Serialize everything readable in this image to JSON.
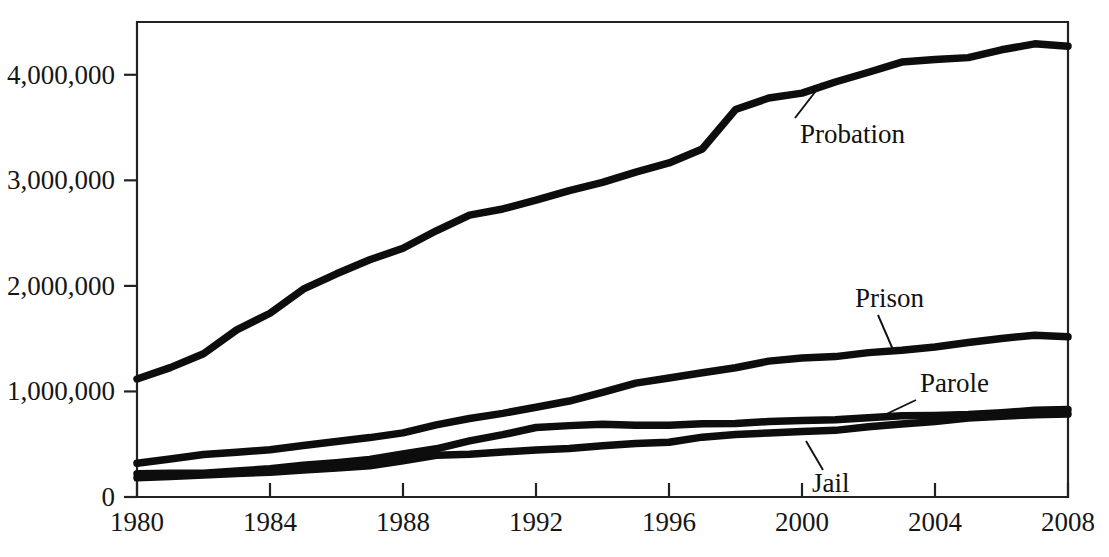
{
  "chart_data": {
    "type": "line",
    "title": "",
    "subtitle": "",
    "xlabel": "",
    "ylabel": "",
    "xlim": [
      1980,
      2008
    ],
    "ylim": [
      0,
      4500000
    ],
    "grid": false,
    "legend_position": "inline-annotations",
    "x_ticks": [
      "1980",
      "1984",
      "1988",
      "1992",
      "1996",
      "2000",
      "2004",
      "2008"
    ],
    "x_tick_values": [
      1980,
      1984,
      1988,
      1992,
      1996,
      2000,
      2004,
      2008
    ],
    "y_ticks": [
      "0",
      "1,000,000",
      "2,000,000",
      "3,000,000",
      "4,000,000"
    ],
    "y_tick_values": [
      0,
      1000000,
      2000000,
      3000000,
      4000000
    ],
    "x": [
      1980,
      1981,
      1982,
      1983,
      1984,
      1985,
      1986,
      1987,
      1988,
      1989,
      1990,
      1991,
      1992,
      1993,
      1994,
      1995,
      1996,
      1997,
      1998,
      1999,
      2000,
      2001,
      2002,
      2003,
      2004,
      2005,
      2006,
      2007,
      2008
    ],
    "series": [
      {
        "name": "Probation",
        "color": "#0d0d0d",
        "values": [
          1118097,
          1225934,
          1357264,
          1582947,
          1740948,
          1968712,
          2114621,
          2247158,
          2356483,
          2522125,
          2670234,
          2728472,
          2811611,
          2903061,
          2981022,
          3077861,
          3164996,
          3296513,
          3670441,
          3779922,
          3826209,
          3931731,
          4024067,
          4120012,
          4143792,
          4162536,
          4236800,
          4293163,
          4270917
        ]
      },
      {
        "name": "Prison",
        "color": "#0d0d0d",
        "values": [
          319598,
          360029,
          402914,
          423898,
          448264,
          487593,
          526436,
          562814,
          607766,
          683367,
          743382,
          792535,
          850566,
          909381,
          990147,
          1078542,
          1127528,
          1176564,
          1224469,
          1287172,
          1316333,
          1330007,
          1367856,
          1390279,
          1421345,
          1462866,
          1502179,
          1532817,
          1518559
        ]
      },
      {
        "name": "Parole",
        "color": "#0d0d0d",
        "values": [
          220438,
          225539,
          224604,
          246440,
          266992,
          300203,
          325638,
          355505,
          407977,
          456803,
          531407,
          590442,
          658601,
          676100,
          690371,
          679421,
          679733,
          694787,
          696385,
          714457,
          723898,
          732333,
          750934,
          769925,
          771852,
          780616,
          798202,
          821177,
          828169
        ]
      },
      {
        "name": "Jail",
        "color": "#0d0d0d",
        "values": [
          182288,
          195085,
          209582,
          223551,
          234500,
          256615,
          274444,
          295873,
          343569,
          395553,
          405320,
          426479,
          444584,
          459804,
          486474,
          507044,
          518492,
          567079,
          592462,
          605943,
          621149,
          631240,
          665475,
          691301,
          713990,
          747529,
          765819,
          780174,
          785556
        ]
      }
    ],
    "annotations": [
      {
        "label": "Probation",
        "text_x": 800,
        "text_y": 143,
        "leader_from_x": 795,
        "leader_from_y": 118,
        "leader_to_x": 822,
        "leader_to_y": 83
      },
      {
        "label": "Prison",
        "text_x": 855,
        "text_y": 307,
        "leader_from_x": 878,
        "leader_from_y": 315,
        "leader_to_x": 894,
        "leader_to_y": 352
      },
      {
        "label": "Parole",
        "text_x": 920,
        "text_y": 392,
        "leader_from_x": 916,
        "leader_from_y": 400,
        "leader_to_x": 878,
        "leader_to_y": 418
      },
      {
        "label": "Jail",
        "text_x": 812,
        "text_y": 492,
        "leader_from_x": 823,
        "leader_from_y": 470,
        "leader_to_x": 806,
        "leader_to_y": 441
      }
    ]
  },
  "plot_frame": {
    "left": 137,
    "right": 1068,
    "top": 22,
    "bottom": 497
  }
}
